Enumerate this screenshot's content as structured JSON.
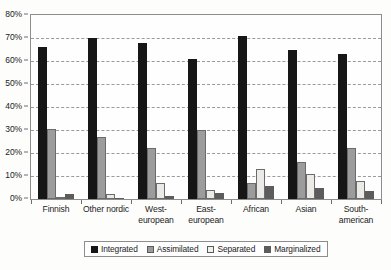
{
  "chart_data": {
    "type": "bar",
    "title": "",
    "xlabel": "",
    "ylabel": "",
    "ylim": [
      0,
      80
    ],
    "ytick_labels": [
      "0%",
      "10%",
      "20%",
      "30%",
      "40%",
      "50%",
      "60%",
      "70%",
      "80%"
    ],
    "ytick_values": [
      0,
      10,
      20,
      30,
      40,
      50,
      60,
      70,
      80
    ],
    "grid": true,
    "legend_position": "bottom",
    "categories": [
      "Finnish",
      "Other nordic",
      "West-european",
      "East-european",
      "African",
      "Asian",
      "South-american"
    ],
    "category_lines": [
      [
        "Finnish"
      ],
      [
        "Other nordic"
      ],
      [
        "West-",
        "european"
      ],
      [
        "East-",
        "european"
      ],
      [
        "African"
      ],
      [
        "Asian"
      ],
      [
        "South-",
        "american"
      ]
    ],
    "series": [
      {
        "name": "Integrated",
        "color": "#161616",
        "values": [
          66,
          70,
          68,
          61,
          71,
          65,
          63
        ]
      },
      {
        "name": "Assimilated",
        "color": "#9c9c9c",
        "values": [
          30.5,
          27,
          22,
          30,
          7,
          16,
          22
        ]
      },
      {
        "name": "Separated",
        "color": "#eceae6",
        "values": [
          1,
          2,
          7,
          4,
          13,
          11,
          8
        ]
      },
      {
        "name": "Marginalized",
        "color": "#5c5c5c",
        "values": [
          2,
          0.5,
          1.5,
          2.5,
          5.5,
          5,
          3.5
        ]
      }
    ]
  }
}
